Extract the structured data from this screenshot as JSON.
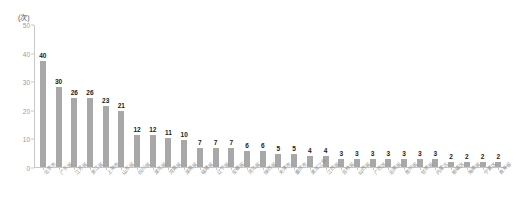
{
  "chart_data": {
    "type": "bar",
    "title": "",
    "subtitle": "",
    "xlabel": "",
    "ylabel": "",
    "unit_label": "(次)",
    "ylim": [
      0,
      50
    ],
    "yticks": [
      0,
      10,
      20,
      30,
      40,
      50
    ],
    "ytick_labels": [
      "0",
      "10",
      "20",
      "30",
      "40",
      "50"
    ],
    "grid": false,
    "legend": null,
    "legend_position": "none",
    "bar_color": "#a8a8a8",
    "value_label_color": "#1a1a1a",
    "axis_color": "#c9c9c9",
    "tick_label_color": "#9a9a9a",
    "category_label_color": "#8f8f8f",
    "category_label_rotation": -45,
    "categories": [
      "北京市",
      "广东省",
      "江苏省",
      "浙江省",
      "上海市",
      "山东省",
      "四川省",
      "湖北省",
      "河南省",
      "湖南省",
      "福建省",
      "辽宁省",
      "安徽省",
      "河北省",
      "陕西省",
      "天津市",
      "重庆市",
      "黑龙江省",
      "江西省",
      "吉林省",
      "山西省",
      "广西区",
      "云南省",
      "贵州省",
      "甘肃省",
      "内蒙古",
      "新疆区",
      "海南省",
      "宁夏区",
      "青海省"
    ],
    "values": [
      40,
      30,
      26,
      26,
      23,
      21,
      12,
      12,
      11,
      10,
      7,
      7,
      7,
      6,
      6,
      5,
      5,
      4,
      4,
      3,
      3,
      3,
      3,
      3,
      3,
      3,
      2,
      2,
      2,
      2
    ]
  }
}
